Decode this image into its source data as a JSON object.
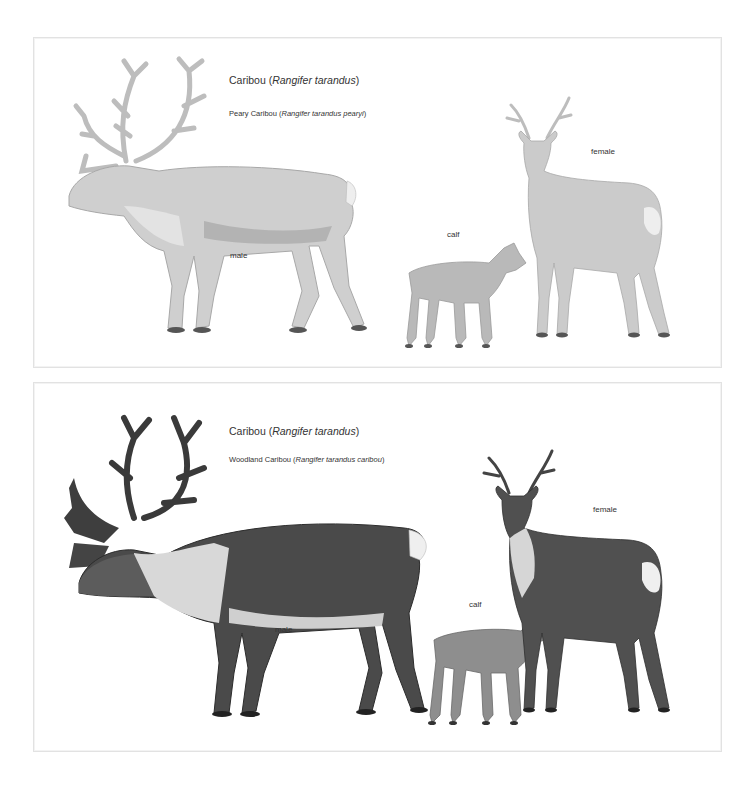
{
  "plates": [
    {
      "title_common": "Caribou (",
      "title_scientific": "Rangifer tarandus",
      "title_close": ")",
      "subspecies_common": "Peary Caribou (",
      "subspecies_scientific": "Rangifer tarandus pearyi",
      "subspecies_close": ")",
      "labels": {
        "male": "male",
        "calf": "calf",
        "female": "female"
      },
      "colors": {
        "body": "#c9c9c9",
        "shade": "#a9a9a9",
        "light": "#e6e6e6",
        "hoof": "#444444"
      }
    },
    {
      "title_common": "Caribou (",
      "title_scientific": "Rangifer tarandus",
      "title_close": ")",
      "subspecies_common": "Woodland Caribou (",
      "subspecies_scientific": "Rangifer tarandus caribou",
      "subspecies_close": ")",
      "labels": {
        "male": "male",
        "calf": "calf",
        "female": "female"
      },
      "colors": {
        "body": "#4a4a4a",
        "shade": "#2f2f2f",
        "light": "#d9d9d9",
        "hoof": "#1e1e1e"
      }
    }
  ]
}
